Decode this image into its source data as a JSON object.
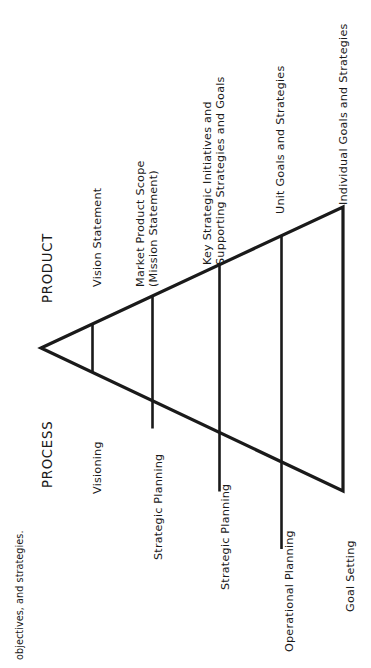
{
  "figure": {
    "caption_fragment": "objectives, and strategies.",
    "axis_labels": {
      "product": "PRODUCT",
      "process": "PROCESS"
    },
    "product_items": [
      {
        "label": "Vision Statement"
      },
      {
        "label": "Market Product Scope\n(Mission Statement)"
      },
      {
        "label": "Key Strategic Initiatives and\nSupporting Strategies and Goals"
      },
      {
        "label": "Unit Goals and Strategies"
      },
      {
        "label": "Individual Goals and Strategies"
      }
    ],
    "process_items": [
      {
        "label": "Visioning"
      },
      {
        "label": "Strategic Planning"
      },
      {
        "label": "Strategic Planning"
      },
      {
        "label": "Operational Planning"
      },
      {
        "label": "Goal Setting"
      }
    ],
    "shape": {
      "type": "triangle",
      "orientation": "apex-left",
      "stroke_color": "#1a1a1a",
      "fill_color": "#ffffff",
      "divider_count": 3
    }
  }
}
